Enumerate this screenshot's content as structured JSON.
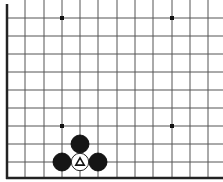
{
  "diagram": {
    "type": "go-board-fragment",
    "corner": "bottom-left",
    "grid": {
      "columns_x": [
        7,
        25,
        44,
        62,
        80,
        98,
        117,
        135,
        153,
        172,
        190,
        208
      ],
      "rows_y": [
        18,
        36,
        54,
        72,
        90,
        108,
        126,
        144,
        162,
        178
      ],
      "edge_left_x": 7,
      "edge_bottom_y": 178,
      "line_color": "#555555",
      "edge_color": "#222222"
    },
    "star_points": [
      {
        "x": 62,
        "y": 18
      },
      {
        "x": 172,
        "y": 18
      },
      {
        "x": 62,
        "y": 126
      },
      {
        "x": 172,
        "y": 126
      }
    ],
    "stones": [
      {
        "color": "black",
        "x": 80,
        "y": 144
      },
      {
        "color": "black",
        "x": 62,
        "y": 162
      },
      {
        "color": "black",
        "x": 98,
        "y": 162
      },
      {
        "color": "white",
        "x": 80,
        "y": 162,
        "marker": "triangle"
      }
    ],
    "stone_radius": 9
  }
}
